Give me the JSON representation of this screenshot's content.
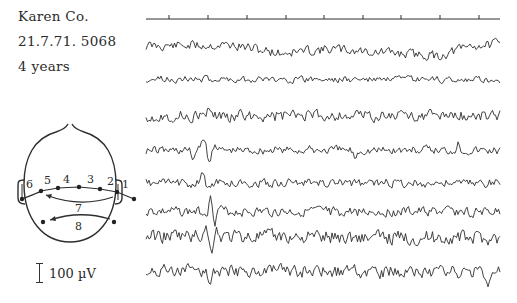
{
  "figure": {
    "patient_name": "Karen Co.",
    "record_line": "21.7.71.  5068",
    "age": "4 years",
    "scale_label": "100 µV"
  },
  "head_diagram": {
    "electrode_labels": [
      "1",
      "2",
      "3",
      "4",
      "5",
      "6",
      "7",
      "8"
    ],
    "derivations": [
      {
        "label": "1",
        "description": "right ear to right temporal"
      },
      {
        "label": "2",
        "description": "right temporal to right parietal"
      },
      {
        "label": "3",
        "description": "right parietal to vertex"
      },
      {
        "label": "4",
        "description": "vertex to left parietal"
      },
      {
        "label": "5",
        "description": "left parietal to left temporal"
      },
      {
        "label": "6",
        "description": "left temporal to left ear"
      },
      {
        "label": "7",
        "description": "right temporal to left temporal (long arc)"
      },
      {
        "label": "8",
        "description": "right occipital to left occipital"
      }
    ]
  },
  "timing_line": {
    "y": 19,
    "x_start": 146,
    "x_end": 500,
    "tick_x": [
      169,
      208,
      247,
      286,
      324,
      363,
      401,
      440,
      479
    ]
  },
  "traces": [
    {
      "channel": 1,
      "baseline_y": 48,
      "amplitude": 4.5,
      "seed": 11,
      "drift": [
        [
          146,
          -2
        ],
        [
          230,
          -3
        ],
        [
          280,
          5
        ],
        [
          330,
          1
        ],
        [
          440,
          8
        ],
        [
          470,
          -2
        ],
        [
          500,
          -4
        ]
      ],
      "spikes": []
    },
    {
      "channel": 2,
      "baseline_y": 80,
      "amplitude": 3.2,
      "seed": 23,
      "drift": [
        [
          146,
          -1
        ],
        [
          500,
          0
        ]
      ],
      "spikes": []
    },
    {
      "channel": 3,
      "baseline_y": 116,
      "amplitude": 5.5,
      "seed": 37,
      "drift": [
        [
          146,
          0
        ],
        [
          500,
          0
        ]
      ],
      "spikes": [
        [
          210,
          -7
        ]
      ]
    },
    {
      "channel": 4,
      "baseline_y": 150,
      "amplitude": 4.0,
      "seed": 41,
      "drift": [
        [
          146,
          0
        ],
        [
          500,
          0
        ]
      ],
      "spikes": [
        [
          193,
          8
        ],
        [
          204,
          -14
        ],
        [
          209,
          14
        ],
        [
          215,
          -8
        ],
        [
          355,
          7
        ],
        [
          458,
          -7
        ]
      ]
    },
    {
      "channel": 5,
      "baseline_y": 183,
      "amplitude": 4.0,
      "seed": 53,
      "drift": [
        [
          146,
          0
        ],
        [
          500,
          0
        ]
      ],
      "spikes": [
        [
          203,
          -11
        ],
        [
          207,
          9
        ]
      ]
    },
    {
      "channel": 6,
      "baseline_y": 212,
      "amplitude": 4.5,
      "seed": 67,
      "drift": [
        [
          146,
          0
        ],
        [
          500,
          0
        ]
      ],
      "spikes": [
        [
          211,
          -14
        ],
        [
          215,
          10
        ],
        [
          219,
          -5
        ]
      ]
    },
    {
      "channel": 7,
      "baseline_y": 238,
      "amplitude": 6.5,
      "seed": 79,
      "drift": [
        [
          146,
          -2
        ],
        [
          500,
          0
        ]
      ],
      "spikes": [
        [
          205,
          -11
        ],
        [
          211,
          15
        ],
        [
          216,
          -8
        ]
      ]
    },
    {
      "channel": 8,
      "baseline_y": 272,
      "amplitude": 6.0,
      "seed": 97,
      "drift": [
        [
          146,
          -1
        ],
        [
          500,
          0
        ]
      ],
      "spikes": [
        [
          210,
          10
        ],
        [
          480,
          -10
        ],
        [
          490,
          12
        ]
      ]
    }
  ],
  "colors": {
    "ink": "#2e2e2e",
    "background": "#ffffff"
  }
}
